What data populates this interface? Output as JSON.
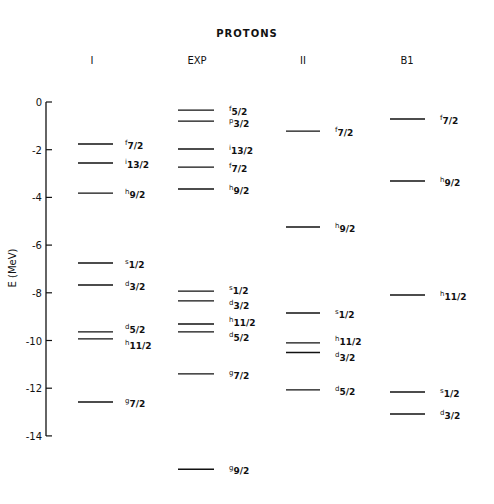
{
  "chart_data": {
    "type": "level-diagram",
    "title": "PROTONS",
    "xlabel": "",
    "ylabel": "E (MeV)",
    "ylim": [
      -14,
      0
    ],
    "yticks": [
      0,
      -2,
      -4,
      -6,
      -8,
      -10,
      -12,
      -14
    ],
    "grid": false,
    "categories": [
      "I",
      "EXP",
      "II",
      "B1"
    ],
    "series": [
      {
        "name": "I",
        "levels": [
          {
            "state": "f",
            "j": "7/2",
            "energy": -1.76
          },
          {
            "state": "i",
            "j": "13/2",
            "energy": -2.56
          },
          {
            "state": "h",
            "j": "9/2",
            "energy": -3.82
          },
          {
            "state": "s",
            "j": "1/2",
            "energy": -6.75
          },
          {
            "state": "d",
            "j": "3/2",
            "energy": -7.67
          },
          {
            "state": "d",
            "j": "5/2",
            "energy": -9.64
          },
          {
            "state": "h",
            "j": "11/2",
            "energy": -9.93
          },
          {
            "state": "g",
            "j": "7/2",
            "energy": -12.58
          }
        ]
      },
      {
        "name": "EXP",
        "levels": [
          {
            "state": "f",
            "j": "5/2",
            "energy": -0.34
          },
          {
            "state": "p",
            "j": "3/2",
            "energy": -0.8
          },
          {
            "state": "i",
            "j": "13/2",
            "energy": -1.97
          },
          {
            "state": "f",
            "j": "7/2",
            "energy": -2.73
          },
          {
            "state": "h",
            "j": "9/2",
            "energy": -3.65
          },
          {
            "state": "s",
            "j": "1/2",
            "energy": -7.93
          },
          {
            "state": "d",
            "j": "3/2",
            "energy": -8.34
          },
          {
            "state": "h",
            "j": "11/2",
            "energy": -9.31
          },
          {
            "state": "d",
            "j": "5/2",
            "energy": -9.64
          },
          {
            "state": "g",
            "j": "7/2",
            "energy": -11.4
          },
          {
            "state": "g",
            "j": "9/2",
            "energy": -15.4
          }
        ]
      },
      {
        "name": "II",
        "levels": [
          {
            "state": "f",
            "j": "7/2",
            "energy": -1.22
          },
          {
            "state": "h",
            "j": "9/2",
            "energy": -5.24
          },
          {
            "state": "s",
            "j": "1/2",
            "energy": -8.85
          },
          {
            "state": "h",
            "j": "11/2",
            "energy": -10.1
          },
          {
            "state": "d",
            "j": "3/2",
            "energy": -10.5
          },
          {
            "state": "d",
            "j": "5/2",
            "energy": -12.07
          }
        ]
      },
      {
        "name": "B1",
        "levels": [
          {
            "state": "f",
            "j": "7/2",
            "energy": -0.71
          },
          {
            "state": "h",
            "j": "9/2",
            "energy": -3.31
          },
          {
            "state": "h",
            "j": "11/2",
            "energy": -8.09
          },
          {
            "state": "s",
            "j": "1/2",
            "energy": -12.16
          },
          {
            "state": "d",
            "j": "3/2",
            "energy": -13.08
          }
        ]
      }
    ]
  },
  "layout": {
    "y0_px": 102,
    "px_per_mev": 23.85,
    "axis_x": 46,
    "columns": [
      {
        "header_x": 92,
        "line_x1": 78,
        "line_x2": 113,
        "label_x": 125
      },
      {
        "header_x": 197,
        "line_x1": 178,
        "line_x2": 214,
        "label_x": 229
      },
      {
        "header_x": 303,
        "line_x1": 286,
        "line_x2": 320,
        "label_x": 335
      },
      {
        "header_x": 407,
        "line_x1": 390,
        "line_x2": 425,
        "label_x": 440
      }
    ],
    "label_offsets": {
      "I": [
        0,
        0,
        0,
        0,
        0,
        -4,
        5,
        0
      ],
      "EXP": [
        0,
        1,
        0,
        0,
        0,
        -2,
        3,
        -3,
        4,
        0,
        0
      ],
      "II": [
        0,
        0,
        0,
        -3,
        4,
        0
      ],
      "B1": [
        0,
        0,
        0,
        0,
        0
      ]
    }
  }
}
